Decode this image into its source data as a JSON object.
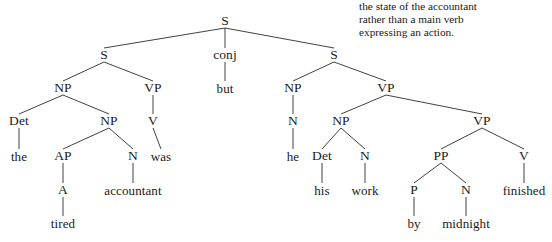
{
  "annotation": {
    "text": "the state of the accountant\nrather than a main verb\nexpressing an action."
  },
  "tree": {
    "nodes": [
      {
        "id": "S-root",
        "label": "S",
        "x": 225,
        "y": 21,
        "kind": "label"
      },
      {
        "id": "S-left",
        "label": "S",
        "x": 104,
        "y": 55,
        "kind": "label"
      },
      {
        "id": "conj",
        "label": "conj",
        "x": 225,
        "y": 55,
        "kind": "label"
      },
      {
        "id": "S-right",
        "label": "S",
        "x": 334,
        "y": 55,
        "kind": "label"
      },
      {
        "id": "but",
        "label": "but",
        "x": 225,
        "y": 88,
        "kind": "leaf"
      },
      {
        "id": "NP-left",
        "label": "NP",
        "x": 63,
        "y": 88,
        "kind": "label"
      },
      {
        "id": "VP-left",
        "label": "VP",
        "x": 153,
        "y": 88,
        "kind": "label"
      },
      {
        "id": "NP-he",
        "label": "NP",
        "x": 293,
        "y": 88,
        "kind": "label"
      },
      {
        "id": "VP-right",
        "label": "VP",
        "x": 386,
        "y": 88,
        "kind": "label"
      },
      {
        "id": "Det-the",
        "label": "Det",
        "x": 19,
        "y": 121,
        "kind": "label"
      },
      {
        "id": "NP-inner",
        "label": "NP",
        "x": 109,
        "y": 121,
        "kind": "label"
      },
      {
        "id": "V-was",
        "label": "V",
        "x": 153,
        "y": 121,
        "kind": "label"
      },
      {
        "id": "N-he",
        "label": "N",
        "x": 293,
        "y": 121,
        "kind": "label"
      },
      {
        "id": "NP-work",
        "label": "NP",
        "x": 341,
        "y": 121,
        "kind": "label"
      },
      {
        "id": "VP-inner",
        "label": "VP",
        "x": 482,
        "y": 121,
        "kind": "label"
      },
      {
        "id": "the",
        "label": "the",
        "x": 19,
        "y": 156,
        "kind": "leaf"
      },
      {
        "id": "AP",
        "label": "AP",
        "x": 63,
        "y": 156,
        "kind": "label"
      },
      {
        "id": "N-accountant",
        "label": "N",
        "x": 133,
        "y": 156,
        "kind": "label"
      },
      {
        "id": "was",
        "label": "was",
        "x": 161,
        "y": 156,
        "kind": "leaf"
      },
      {
        "id": "he",
        "label": "he",
        "x": 293,
        "y": 156,
        "kind": "leaf"
      },
      {
        "id": "Det-his",
        "label": "Det",
        "x": 322,
        "y": 156,
        "kind": "label"
      },
      {
        "id": "N-work",
        "label": "N",
        "x": 365,
        "y": 156,
        "kind": "label"
      },
      {
        "id": "PP",
        "label": "PP",
        "x": 441,
        "y": 156,
        "kind": "label"
      },
      {
        "id": "V-finished",
        "label": "V",
        "x": 524,
        "y": 156,
        "kind": "label"
      },
      {
        "id": "A",
        "label": "A",
        "x": 63,
        "y": 190,
        "kind": "label"
      },
      {
        "id": "accountant",
        "label": "accountant",
        "x": 133,
        "y": 190,
        "kind": "leaf"
      },
      {
        "id": "his",
        "label": "his",
        "x": 322,
        "y": 190,
        "kind": "leaf"
      },
      {
        "id": "work",
        "label": "work",
        "x": 365,
        "y": 190,
        "kind": "leaf"
      },
      {
        "id": "P",
        "label": "P",
        "x": 414,
        "y": 190,
        "kind": "label"
      },
      {
        "id": "N-midnight",
        "label": "N",
        "x": 466,
        "y": 190,
        "kind": "label"
      },
      {
        "id": "finished",
        "label": "finished",
        "x": 524,
        "y": 190,
        "kind": "leaf"
      },
      {
        "id": "tired",
        "label": "tired",
        "x": 63,
        "y": 223,
        "kind": "leaf"
      },
      {
        "id": "by",
        "label": "by",
        "x": 414,
        "y": 223,
        "kind": "leaf"
      },
      {
        "id": "midnight",
        "label": "midnight",
        "x": 466,
        "y": 223,
        "kind": "leaf"
      }
    ],
    "edges": [
      {
        "from": "S-root",
        "to": "S-left"
      },
      {
        "from": "S-root",
        "to": "conj"
      },
      {
        "from": "S-root",
        "to": "S-right"
      },
      {
        "from": "conj",
        "to": "but"
      },
      {
        "from": "S-left",
        "to": "NP-left"
      },
      {
        "from": "S-left",
        "to": "VP-left"
      },
      {
        "from": "NP-left",
        "to": "Det-the"
      },
      {
        "from": "NP-left",
        "to": "NP-inner"
      },
      {
        "from": "VP-left",
        "to": "V-was"
      },
      {
        "from": "Det-the",
        "to": "the"
      },
      {
        "from": "NP-inner",
        "to": "AP"
      },
      {
        "from": "NP-inner",
        "to": "N-accountant"
      },
      {
        "from": "V-was",
        "to": "was"
      },
      {
        "from": "AP",
        "to": "A"
      },
      {
        "from": "A",
        "to": "tired"
      },
      {
        "from": "N-accountant",
        "to": "accountant"
      },
      {
        "from": "S-right",
        "to": "NP-he"
      },
      {
        "from": "S-right",
        "to": "VP-right"
      },
      {
        "from": "NP-he",
        "to": "N-he"
      },
      {
        "from": "N-he",
        "to": "he"
      },
      {
        "from": "VP-right",
        "to": "NP-work"
      },
      {
        "from": "VP-right",
        "to": "VP-inner"
      },
      {
        "from": "NP-work",
        "to": "Det-his"
      },
      {
        "from": "NP-work",
        "to": "N-work"
      },
      {
        "from": "Det-his",
        "to": "his"
      },
      {
        "from": "N-work",
        "to": "work"
      },
      {
        "from": "VP-inner",
        "to": "PP"
      },
      {
        "from": "VP-inner",
        "to": "V-finished"
      },
      {
        "from": "PP",
        "to": "P"
      },
      {
        "from": "PP",
        "to": "N-midnight"
      },
      {
        "from": "P",
        "to": "by"
      },
      {
        "from": "N-midnight",
        "to": "midnight"
      },
      {
        "from": "V-finished",
        "to": "finished"
      }
    ],
    "style": {
      "line_color": "#2b2b2b",
      "text_color": "#1a1a1a",
      "background": "#ffffff"
    }
  }
}
